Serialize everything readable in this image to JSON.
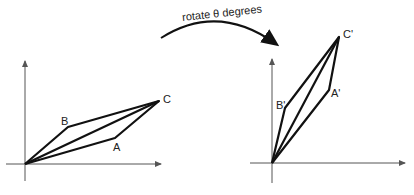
{
  "diagram": {
    "arrow_label": "rotate θ degrees",
    "before": {
      "points": {
        "A": "A",
        "B": "B",
        "C": "C"
      }
    },
    "after": {
      "points": {
        "A": "A'",
        "B": "B'",
        "C": "C'"
      }
    },
    "colors": {
      "stroke": "#111111",
      "axis": "#555555",
      "text": "#222222"
    }
  }
}
